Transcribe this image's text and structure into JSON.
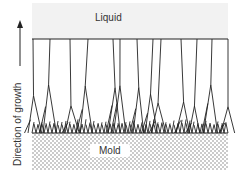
{
  "labels": {
    "liquid": "Liquid",
    "mold": "Mold",
    "axis": "Direction of growth"
  },
  "colors": {
    "liquid_fill": "#f2f2f2",
    "line": "#222222",
    "mold_dot": "#8a8a8a"
  },
  "regions": {
    "liquid": {
      "x": 32,
      "y": 3,
      "w": 196,
      "h": 36
    },
    "solid": {
      "x": 32,
      "y": 39,
      "w": 196,
      "h": 94
    },
    "mold": {
      "x": 32,
      "y": 133,
      "w": 196,
      "h": 37
    }
  },
  "grains_top_x": [
    33,
    50,
    70,
    88,
    113,
    120,
    137,
    153,
    161,
    181,
    197,
    212,
    228
  ],
  "arrow": {
    "x": 20,
    "y_top": 24,
    "y_bottom": 64
  }
}
